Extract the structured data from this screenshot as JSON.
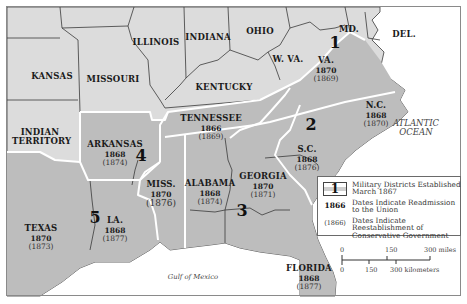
{
  "colors": {
    "union_state": "#dcdcdc",
    "confederate_state": "#bdbdbd",
    "water": "#ffffff",
    "state_border": "#3a3a3a",
    "district_border": "#ffffff",
    "frame": "#8a8a8a"
  },
  "non_confederate_states": [
    {
      "name": "KANSAS"
    },
    {
      "name": "MISSOURI"
    },
    {
      "name": "ILLINOIS"
    },
    {
      "name": "INDIANA"
    },
    {
      "name": "OHIO"
    },
    {
      "name": "KENTUCKY"
    },
    {
      "name": "W. VA."
    },
    {
      "name": "MD."
    },
    {
      "name": "DEL."
    },
    {
      "name": "INDIAN TERRITORY"
    }
  ],
  "confederate_states": [
    {
      "name": "VA.",
      "readmission": "1870",
      "conservative": "(1869)"
    },
    {
      "name": "N.C.",
      "readmission": "1868",
      "conservative": "(1870)"
    },
    {
      "name": "S.C.",
      "readmission": "1868",
      "conservative": "(1876)"
    },
    {
      "name": "TENNESSEE",
      "readmission": "1866",
      "conservative": "(1869)"
    },
    {
      "name": "ARKANSAS",
      "readmission": "1868",
      "conservative": "(1874)"
    },
    {
      "name": "MISS.",
      "readmission": "1870",
      "conservative": "(1876)"
    },
    {
      "name": "ALABAMA",
      "readmission": "1868",
      "conservative": "(1874)"
    },
    {
      "name": "GEORGIA",
      "readmission": "1870",
      "conservative": "(1871)"
    },
    {
      "name": "TEXAS",
      "readmission": "1870",
      "conservative": "(1873)"
    },
    {
      "name": "LA.",
      "readmission": "1868",
      "conservative": "(1877)"
    },
    {
      "name": "FLORIDA",
      "readmission": "1868",
      "conservative": "(1877)"
    }
  ],
  "military_districts": [
    "1",
    "2",
    "3",
    "4",
    "5"
  ],
  "water_labels": {
    "atlantic_line1": "ATLANTIC",
    "atlantic_line2": "OCEAN",
    "gulf": "Gulf of Mexico"
  },
  "legend": {
    "district_key": "1",
    "district_text": "Military Districts Established March 1867",
    "readmission_key": "1866",
    "readmission_text": "Dates Indicate Readmission to the Union",
    "conservative_key": "(1866)",
    "conservative_text": "Dates Indicate Reestablishment of Conservative Government"
  },
  "scale": {
    "miles_ticks": [
      "0",
      "150",
      "300 miles"
    ],
    "km_ticks": [
      "0",
      "150",
      "300 kilometers"
    ]
  }
}
